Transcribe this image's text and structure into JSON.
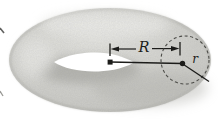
{
  "figure": {
    "labels": {
      "major_radius": "R",
      "minor_radius": "r"
    },
    "colors": {
      "background": "#ffffff",
      "torus_fill": "#d6d6d2",
      "torus_shadow": "#a5a5a0",
      "torus_highlight": "#ebebe8",
      "hole_fill": "#ffffff",
      "line_color": "#1c1c1a",
      "dashed_circle_color": "#4c4c48"
    }
  }
}
